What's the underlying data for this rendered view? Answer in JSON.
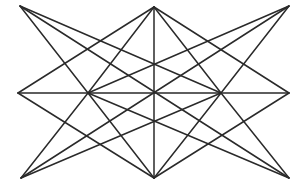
{
  "diagram": {
    "type": "geometric-line-figure",
    "stroke_color": "#2a2a2a",
    "background": "#ffffff",
    "vertices": {
      "TL": [
        20,
        6
      ],
      "T": [
        154,
        7
      ],
      "TR": [
        289,
        6
      ],
      "ML": [
        18,
        93
      ],
      "L": [
        88,
        93
      ],
      "C": [
        154,
        93
      ],
      "R": [
        221,
        93
      ],
      "MR": [
        289,
        93
      ],
      "BL": [
        21,
        178
      ],
      "B": [
        154,
        178
      ],
      "BR": [
        289,
        178
      ]
    },
    "edges": [
      [
        "ML",
        "MR"
      ],
      [
        "T",
        "B"
      ],
      [
        "T",
        "ML"
      ],
      [
        "T",
        "MR"
      ],
      [
        "T",
        "L"
      ],
      [
        "T",
        "R"
      ],
      [
        "B",
        "ML"
      ],
      [
        "B",
        "MR"
      ],
      [
        "B",
        "L"
      ],
      [
        "B",
        "R"
      ],
      [
        "TL",
        "L"
      ],
      [
        "TL",
        "R"
      ],
      [
        "TL",
        "BR"
      ],
      [
        "TR",
        "R"
      ],
      [
        "TR",
        "L"
      ],
      [
        "TR",
        "BL"
      ],
      [
        "BL",
        "L"
      ],
      [
        "BL",
        "R"
      ],
      [
        "BR",
        "R"
      ],
      [
        "BR",
        "L"
      ]
    ]
  }
}
